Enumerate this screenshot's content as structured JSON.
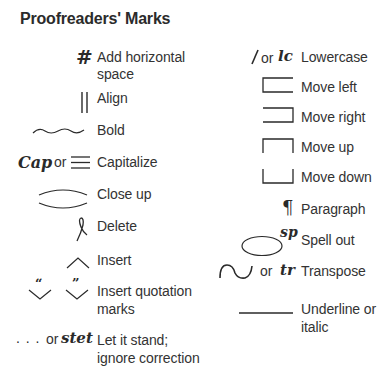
{
  "title": "Proofreaders' Marks",
  "left_column": [
    {
      "mark": "#",
      "mark_name": "pound-sign",
      "label_line1": "Add horizontal",
      "label_line2": "space"
    },
    {
      "mark": "||",
      "mark_name": "double-vertical-bar",
      "label_line1": "Align"
    },
    {
      "mark": "~~~",
      "mark_name": "wavy-underline",
      "label_line1": "Bold"
    },
    {
      "mark_alt": "Cap",
      "or": "or",
      "mark_name": "triple-underline",
      "label_line1": "Capitalize"
    },
    {
      "mark_name": "close-up-arcs",
      "label_line1": "Close up"
    },
    {
      "mark_name": "delete-loop",
      "label_line1": "Delete"
    },
    {
      "mark": "^",
      "mark_name": "caret",
      "label_line1": "Insert"
    },
    {
      "mark_quote_open": "“",
      "mark_quote_close": "”",
      "mark_name": "quotation-carets",
      "label_line1": "Insert quotation",
      "label_line2": "marks"
    },
    {
      "mark": ". . .",
      "or": "or",
      "mark_alt": "stet",
      "mark_name": "stet-dots",
      "label_line1": "Let it stand;",
      "label_line2": "ignore correction"
    }
  ],
  "right_column": [
    {
      "mark": "/",
      "or": "or",
      "mark_alt": "lc",
      "mark_name": "slash-lowercase",
      "label_line1": "Lowercase"
    },
    {
      "mark_name": "move-left-bracket",
      "label_line1": "Move left"
    },
    {
      "mark_name": "move-right-bracket",
      "label_line1": "Move right"
    },
    {
      "mark_name": "move-up-bracket",
      "label_line1": "Move up"
    },
    {
      "mark_name": "move-down-bracket",
      "label_line1": "Move down"
    },
    {
      "mark": "¶",
      "mark_name": "paragraph-sign",
      "label_line1": "Paragraph"
    },
    {
      "mark_alt": "sp",
      "mark_name": "spell-out-ellipse",
      "label_line1": "Spell out"
    },
    {
      "or": "or",
      "mark_alt": "tr",
      "mark_name": "transpose-curve",
      "label_line1": "Transpose"
    },
    {
      "mark_name": "underline-rule",
      "label_line1": "Underline or",
      "label_line2": "italic"
    }
  ],
  "colors": {
    "ink": "#2a2a2a",
    "background": "#ffffff"
  }
}
